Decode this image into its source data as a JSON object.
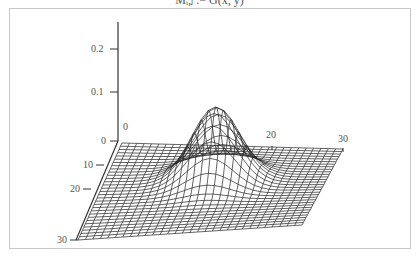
{
  "caption": "Mᵢ,ⱼ := G(x, y)",
  "chart_data": {
    "type": "surface",
    "style": "wireframe",
    "title": "",
    "function": "2D Gaussian bump",
    "grid": {
      "rows": 31,
      "cols": 31
    },
    "x_axis": {
      "ticks": [
        0,
        20,
        30
      ],
      "range": [
        0,
        30
      ]
    },
    "y_axis": {
      "ticks": [
        0,
        10,
        20,
        30
      ],
      "range": [
        0,
        30
      ]
    },
    "z_axis": {
      "ticks": [
        0,
        0.1,
        0.2
      ],
      "range": [
        0,
        0.24
      ]
    },
    "peak": {
      "x": 15,
      "y": 12,
      "z": 0.16
    },
    "sigma": 3.2,
    "colors": {
      "mesh": "#222222",
      "axis": "#333333",
      "label": "#555555"
    }
  },
  "labels": {
    "z": [
      "0.2",
      "0.1",
      "0"
    ],
    "x": [
      "0",
      "20",
      "30"
    ],
    "y": [
      "10",
      "20",
      "30"
    ]
  }
}
